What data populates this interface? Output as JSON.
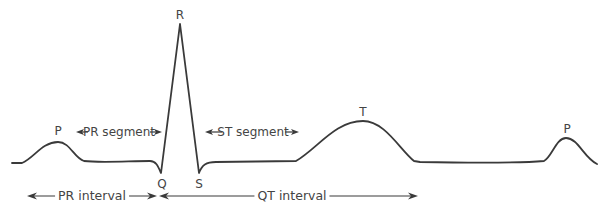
{
  "diagram": {
    "stroke_color": "#3a3a3a",
    "text_color": "#444444",
    "waves": {
      "P1": "P",
      "Q": "Q",
      "R": "R",
      "S": "S",
      "T": "T",
      "P2": "P"
    },
    "segments": {
      "pr_segment": "PR segment",
      "st_segment": "ST segment"
    },
    "intervals": {
      "pr_interval": "PR interval",
      "qt_interval": "QT interval"
    }
  }
}
